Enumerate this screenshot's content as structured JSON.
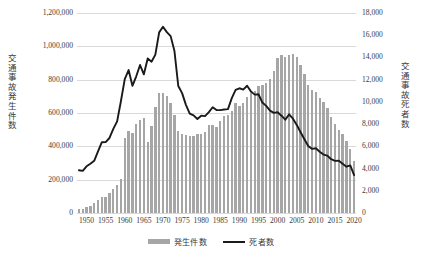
{
  "chart_data": {
    "type": "bar",
    "title": "",
    "xlabel": "",
    "grid": true,
    "legend_position": "bottom",
    "x": [
      1948,
      1949,
      1950,
      1951,
      1952,
      1953,
      1954,
      1955,
      1956,
      1957,
      1958,
      1959,
      1960,
      1961,
      1962,
      1963,
      1964,
      1965,
      1966,
      1967,
      1968,
      1969,
      1970,
      1971,
      1972,
      1973,
      1974,
      1975,
      1976,
      1977,
      1978,
      1979,
      1980,
      1981,
      1982,
      1983,
      1984,
      1985,
      1986,
      1987,
      1988,
      1989,
      1990,
      1991,
      1992,
      1993,
      1994,
      1995,
      1996,
      1997,
      1998,
      1999,
      2000,
      2001,
      2002,
      2003,
      2004,
      2005,
      2006,
      2007,
      2008,
      2009,
      2010,
      2011,
      2012,
      2013,
      2014,
      2015,
      2016,
      2017,
      2018,
      2019,
      2020
    ],
    "xtick_labels": [
      "1950",
      "1955",
      "1960",
      "1965",
      "1970",
      "1975",
      "1980",
      "1985",
      "1990",
      "1995",
      "2000",
      "2005",
      "2010",
      "2015",
      "2020"
    ],
    "axes": [
      {
        "side": "left",
        "name": "発生件数",
        "label": "交通事故発生件数",
        "ylim": [
          0,
          1200000
        ],
        "yticks": [
          0,
          200000,
          400000,
          600000,
          800000,
          1000000,
          1200000
        ],
        "ytick_labels": [
          "0",
          "200,000",
          "400,000",
          "600,000",
          "800,000",
          "1,000,000",
          "1,200,000"
        ]
      },
      {
        "side": "right",
        "name": "死者数",
        "label": "交通事故死者数",
        "ylim": [
          0,
          18000
        ],
        "yticks": [
          0,
          2000,
          4000,
          6000,
          8000,
          10000,
          12000,
          14000,
          16000,
          18000
        ],
        "ytick_labels": [
          "0",
          "2,000",
          "4,000",
          "6,000",
          "8,000",
          "10,000",
          "12,000",
          "14,000",
          "16,000",
          "18,000"
        ]
      }
    ],
    "series": [
      {
        "name": "発生件数",
        "type": "bar",
        "axis": "left",
        "color": "#a6a6a6",
        "values": [
          21341,
          25113,
          33212,
          41423,
          58487,
          80019,
          93869,
          93981,
          122691,
          146833,
          168799,
          201292,
          449917,
          493693,
          479825,
          531966,
          557183,
          567286,
          425944,
          521481,
          635056,
          720880,
          718080,
          700290,
          659283,
          586713,
          490452,
          472938,
          471041,
          460649,
          464037,
          471573,
          476677,
          485578,
          526362,
          526233,
          518642,
          552788,
          579190,
          590723,
          614481,
          661363,
          643097,
          662388,
          695345,
          724675,
          729457,
          761789,
          771084,
          780399,
          803882,
          850363,
          931950,
          947253,
          936950,
          948281,
          952720,
          934346,
          887267,
          832704,
          766394,
          737637,
          725924,
          692084,
          665157,
          629033,
          573842,
          536899,
          499201,
          472165,
          430601,
          381237,
          309178
        ]
      },
      {
        "name": "死者数",
        "type": "line",
        "axis": "right",
        "color": "#1a1a1a",
        "values": [
          3848,
          3790,
          4202,
          4429,
          4696,
          5544,
          6374,
          6379,
          6751,
          7575,
          8248,
          10079,
          12055,
          12865,
          11445,
          12301,
          13318,
          12484,
          13904,
          13618,
          14256,
          16257,
          16765,
          16278,
          15918,
          14574,
          11432,
          10792,
          9734,
          8945,
          8783,
          8466,
          8760,
          8719,
          9073,
          9520,
          9262,
          9261,
          9317,
          9347,
          10344,
          11086,
          11227,
          11109,
          11452,
          10945,
          10653,
          10684,
          9943,
          9642,
          9214,
          9012,
          9073,
          8757,
          8396,
          8877,
          8492,
          7931,
          7272,
          6639,
          6023,
          5772,
          5828,
          5507,
          5261,
          5165,
          4838,
          4691,
          4698,
          4431,
          4166,
          4279,
          3416
        ]
      }
    ],
    "annotations": {
      "deaths_peak_year": 1970,
      "deaths_peak_value": 16765,
      "accidents_peak_year": 2004,
      "accidents_peak_value": 952720
    }
  },
  "legend": {
    "items": [
      {
        "label": "発生件数",
        "marker": "bar-swatch"
      },
      {
        "label": "死者数",
        "marker": "line-swatch"
      }
    ]
  },
  "colors": {
    "bar": "#a6a6a6",
    "line": "#1a1a1a",
    "grid": "#d9d9d9",
    "text": "#3a3a3a",
    "background": "#ffffff"
  }
}
